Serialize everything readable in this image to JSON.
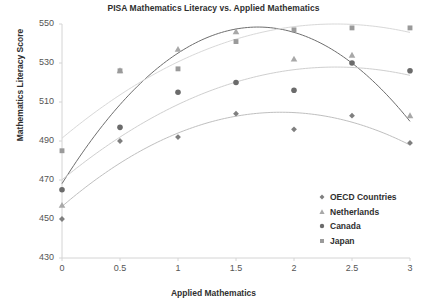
{
  "chart_data": {
    "type": "scatter",
    "title": "PISA Mathematics Literacy vs. Applied Mathematics",
    "xlabel": "Applied Mathematics",
    "ylabel": "Mathematics Literacy Score",
    "xlim": [
      0,
      3
    ],
    "ylim": [
      430,
      550
    ],
    "xticks": [
      "0",
      "0.5",
      "1",
      "1.5",
      "2",
      "2.5",
      "3"
    ],
    "xtick_values": [
      0,
      0.5,
      1,
      1.5,
      2,
      2.5,
      3
    ],
    "yticks": [
      "430",
      "450",
      "470",
      "490",
      "510",
      "530",
      "550"
    ],
    "ytick_values": [
      430,
      450,
      470,
      490,
      510,
      530,
      550
    ],
    "grid": false,
    "legend_position": "right-lower",
    "x": [
      0,
      0.5,
      1,
      1.5,
      2,
      2.5,
      3
    ],
    "series": [
      {
        "name": "OECD Countries",
        "marker": "diamond",
        "color": "#7f7f7f",
        "trendline_color": "#bfbfbf",
        "values": [
          450,
          490,
          492,
          504,
          496,
          503,
          489
        ]
      },
      {
        "name": "Netherlands",
        "marker": "triangle",
        "color": "#a8a8a8",
        "trendline_color": "#6e6e6e",
        "values": [
          457,
          526,
          537,
          546,
          532,
          534,
          503
        ]
      },
      {
        "name": "Canada",
        "marker": "circle",
        "color": "#6b6b6b",
        "trendline_color": "#cfcfcf",
        "values": [
          465,
          497,
          515,
          520,
          516,
          530,
          526
        ]
      },
      {
        "name": "Japan",
        "marker": "square",
        "color": "#9a9a9a",
        "trendline_color": "#d8d8d8",
        "values": [
          485,
          526,
          527,
          541,
          547,
          548,
          548
        ]
      }
    ]
  },
  "legend": {
    "items": [
      {
        "label": "OECD Countries",
        "marker": "diamond",
        "color": "#7f7f7f"
      },
      {
        "label": "Netherlands",
        "marker": "triangle",
        "color": "#a8a8a8"
      },
      {
        "label": "Canada",
        "marker": "circle",
        "color": "#6b6b6b"
      },
      {
        "label": "Japan",
        "marker": "square",
        "color": "#9a9a9a"
      }
    ]
  }
}
